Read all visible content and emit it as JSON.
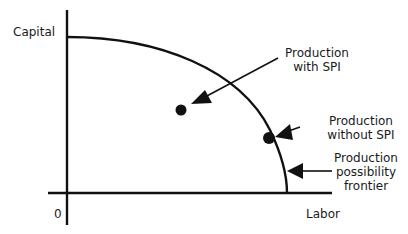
{
  "diagram": {
    "type": "production-possibility-frontier",
    "axes": {
      "y_label": "Capital",
      "x_label": "Labor",
      "origin_label": "0"
    },
    "annotations": [
      {
        "id": "with-spi",
        "lines": [
          "Production",
          "with SPI"
        ]
      },
      {
        "id": "without-spi",
        "lines": [
          "Production",
          "without SPI"
        ]
      },
      {
        "id": "ppf",
        "lines": [
          "Production",
          "possibility",
          "frontier"
        ]
      }
    ],
    "points": [
      {
        "id": "point-with-spi",
        "label": "Production with SPI",
        "position": "inside frontier"
      },
      {
        "id": "point-without-spi",
        "label": "Production without SPI",
        "position": "on frontier"
      }
    ],
    "colors": {
      "line": "#111111",
      "background": "#ffffff"
    }
  }
}
